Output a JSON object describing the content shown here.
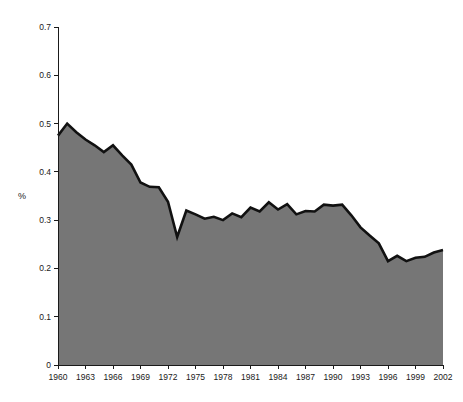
{
  "chart_data": {
    "type": "area",
    "title": "",
    "subtitle": "",
    "xlabel": "",
    "ylabel": "%",
    "xlim": [
      1960,
      2002
    ],
    "ylim": [
      0,
      0.7
    ],
    "grid": false,
    "legend": null,
    "fill_color": "#767676",
    "line_color": "#111111",
    "background_color": "#ffffff",
    "ytick_labels": [
      "0",
      "0.1",
      "0.2",
      "0.3",
      "0.4",
      "0.5",
      "0.6",
      "0.7"
    ],
    "ytick_values": [
      0,
      0.1,
      0.2,
      0.3,
      0.4,
      0.5,
      0.6,
      0.7
    ],
    "xtick_labels": [
      "1960",
      "1963",
      "1966",
      "1969",
      "1972",
      "1975",
      "1978",
      "1981",
      "1984",
      "1987",
      "1990",
      "1993",
      "1996",
      "1999",
      "2002"
    ],
    "xtick_values": [
      1960,
      1963,
      1966,
      1969,
      1972,
      1975,
      1978,
      1981,
      1984,
      1987,
      1990,
      1993,
      1996,
      1999,
      2002
    ],
    "x": [
      1960,
      1961,
      1962,
      1963,
      1964,
      1965,
      1966,
      1967,
      1968,
      1969,
      1970,
      1971,
      1972,
      1973,
      1974,
      1975,
      1976,
      1977,
      1978,
      1979,
      1980,
      1981,
      1982,
      1983,
      1984,
      1985,
      1986,
      1987,
      1988,
      1989,
      1990,
      1991,
      1992,
      1993,
      1994,
      1995,
      1996,
      1997,
      1998,
      1999,
      2000,
      2001,
      2002
    ],
    "values": [
      0.475,
      0.5,
      0.482,
      0.467,
      0.455,
      0.441,
      0.455,
      0.434,
      0.415,
      0.378,
      0.369,
      0.368,
      0.338,
      0.265,
      0.32,
      0.312,
      0.303,
      0.307,
      0.3,
      0.314,
      0.306,
      0.326,
      0.318,
      0.337,
      0.322,
      0.333,
      0.312,
      0.319,
      0.318,
      0.332,
      0.33,
      0.332,
      0.31,
      0.285,
      0.268,
      0.252,
      0.215,
      0.226,
      0.215,
      0.222,
      0.224,
      0.233,
      0.238
    ],
    "series": [
      {
        "name": "%",
        "values": [
          0.475,
          0.5,
          0.482,
          0.467,
          0.455,
          0.441,
          0.455,
          0.434,
          0.415,
          0.378,
          0.369,
          0.368,
          0.338,
          0.265,
          0.32,
          0.312,
          0.303,
          0.307,
          0.3,
          0.314,
          0.306,
          0.326,
          0.318,
          0.337,
          0.322,
          0.333,
          0.312,
          0.319,
          0.318,
          0.332,
          0.33,
          0.332,
          0.31,
          0.285,
          0.268,
          0.252,
          0.215,
          0.226,
          0.215,
          0.222,
          0.224,
          0.233,
          0.238
        ]
      }
    ]
  }
}
